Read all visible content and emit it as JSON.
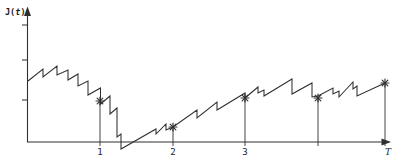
{
  "figure": {
    "bg_color": "#ffffff",
    "line_color": "#2f2f2f",
    "y_axis_label_prefix": "J(",
    "y_axis_label_var": "t",
    "y_axis_label_suffix": ")"
  },
  "chart_data": {
    "type": "line",
    "title": "",
    "xlabel": "t",
    "ylabel": "J(t)",
    "grid": false,
    "legend": "none",
    "x_tick_labels": [
      "1",
      "2",
      "3",
      "",
      "T"
    ],
    "y_tick_labels": [
      "",
      "",
      ""
    ],
    "x_axis_ends_with_arrow": true,
    "y_axis_ends_with_arrow": true,
    "x_range_units": [
      0,
      4.97
    ],
    "T_units": 4.9,
    "curve_shape": "sawtooth: gradual linear rises with sudden vertical drops; overall decline from t=0 to t≈1.3 dipping just below the x-axis, then repeating rising ramps up to t=T",
    "marked_points_units": [
      {
        "t": 1,
        "J": 1.05
      },
      {
        "t": 2,
        "J": 0.38
      },
      {
        "t": 3,
        "J": 1.13
      },
      {
        "t": 4,
        "J": 1.13
      },
      {
        "t": 4.9,
        "J": 1.51
      }
    ],
    "axis_px": {
      "origin": [
        27,
        142
      ],
      "x_end": [
        391,
        142
      ],
      "y_top": [
        27,
        9
      ],
      "x_unit_px": 73,
      "y_unit_px": 39
    },
    "y_ticks_px": [
      25,
      60,
      100
    ],
    "curve_px": [
      [
        28,
        81
      ],
      [
        43,
        69
      ],
      [
        43,
        77
      ],
      [
        57,
        66
      ],
      [
        57,
        75
      ],
      [
        68,
        70
      ],
      [
        68,
        80
      ],
      [
        78,
        74
      ],
      [
        78,
        86
      ],
      [
        88,
        81
      ],
      [
        88,
        95
      ],
      [
        100.5,
        88
      ],
      [
        100.5,
        104
      ],
      [
        110,
        96
      ],
      [
        110,
        114
      ],
      [
        117,
        108
      ],
      [
        117,
        137
      ],
      [
        121,
        134
      ],
      [
        121,
        149
      ],
      [
        156,
        129
      ],
      [
        156,
        134
      ],
      [
        166,
        124
      ],
      [
        166,
        130
      ],
      [
        173,
        127
      ],
      [
        197,
        110
      ],
      [
        197,
        118
      ],
      [
        217,
        102
      ],
      [
        217,
        110
      ],
      [
        245,
        93
      ],
      [
        245,
        98
      ],
      [
        258,
        87
      ],
      [
        258,
        93
      ],
      [
        264,
        90
      ],
      [
        264,
        96
      ],
      [
        292,
        79
      ],
      [
        292,
        94
      ],
      [
        312,
        83
      ],
      [
        312,
        97
      ],
      [
        318,
        96
      ],
      [
        333,
        88
      ],
      [
        333,
        94
      ],
      [
        339,
        91
      ],
      [
        339,
        97
      ],
      [
        353,
        82
      ],
      [
        353,
        89
      ],
      [
        357,
        86
      ],
      [
        357,
        96
      ],
      [
        385,
        83
      ]
    ],
    "markers_px": [
      {
        "x": 100,
        "y": 101,
        "label": "1",
        "label_dx": 0
      },
      {
        "x": 173,
        "y": 127,
        "label": "2",
        "label_dx": 0
      },
      {
        "x": 245,
        "y": 98,
        "label": "3",
        "label_dx": 0
      },
      {
        "x": 318,
        "y": 98,
        "label": "",
        "label_dx": 0
      },
      {
        "x": 385,
        "y": 83,
        "label": "T",
        "label_dx": 3
      }
    ]
  }
}
